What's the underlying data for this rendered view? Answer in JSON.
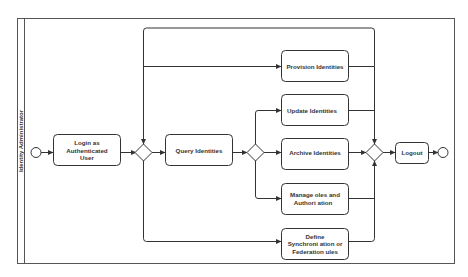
{
  "diagram": {
    "type": "BPMN activity diagram",
    "lane": {
      "label": "Identity Administrator"
    },
    "events": {
      "start": "start-event",
      "end": "end-event"
    },
    "tasks": {
      "login": {
        "lines": [
          "Login as",
          "Authenticated",
          "User"
        ]
      },
      "query": {
        "lines": [
          "Query Identities"
        ]
      },
      "provision": {
        "lines": [
          "Provision Identities"
        ]
      },
      "update": {
        "lines": [
          "Update Identities"
        ]
      },
      "archive": {
        "lines": [
          "Archive Identities"
        ]
      },
      "manage": {
        "lines": [
          "Manage  oles and",
          "Authori ation"
        ]
      },
      "define": {
        "lines": [
          "Define",
          "Synchroni ation or",
          "Federation  ules"
        ]
      },
      "logout": {
        "lines": [
          "Logout"
        ]
      }
    },
    "gateways": [
      "exclusive-gateway-1",
      "exclusive-gateway-2",
      "exclusive-gateway-3"
    ],
    "colors": {
      "stroke": "#333333",
      "fill": "#ffffff",
      "text": "#333333"
    }
  }
}
